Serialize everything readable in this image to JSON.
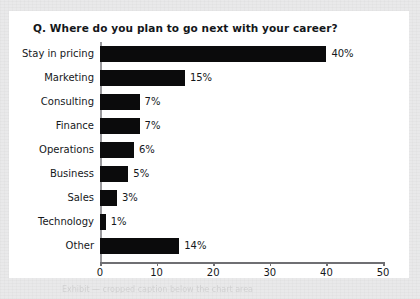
{
  "page": {
    "background_color": "#e9e9ea",
    "panel_color": "#ffffff"
  },
  "chart_data": {
    "type": "bar",
    "orientation": "horizontal",
    "title": "Q. Where do you plan to go next with your career?",
    "xlabel": "",
    "ylabel": "",
    "xlim": [
      0,
      50
    ],
    "xticks": [
      0,
      10,
      20,
      30,
      40,
      50
    ],
    "grid": false,
    "legend": null,
    "bar_color": "#0b0b0c",
    "categories": [
      "Stay in pricing",
      "Marketing",
      "Consulting",
      "Finance",
      "Operations",
      "Business",
      "Sales",
      "Technology",
      "Other"
    ],
    "values": [
      40,
      15,
      7,
      7,
      6,
      5,
      3,
      1,
      14
    ],
    "data_labels": [
      "40%",
      "15%",
      "7%",
      "7%",
      "6%",
      "5%",
      "3%",
      "1%",
      "14%"
    ]
  },
  "caption": {
    "ghost_text": "Exhibit — cropped caption below the chart area"
  }
}
